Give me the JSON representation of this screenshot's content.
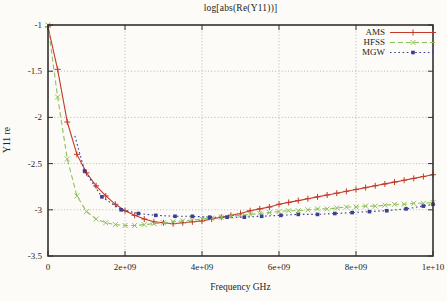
{
  "figure": {
    "background": "#fcfbf7",
    "axis_color": "#33312c",
    "grid_color": "#b8b8b8",
    "text_color": "#26241e"
  },
  "chart_data": {
    "type": "line",
    "title": "log[abs(Re(Y11))]",
    "xlabel": "Frequency GHz",
    "ylabel": "Y11 re",
    "xlim": [
      0,
      10
    ],
    "ylim": [
      -3.5,
      -1
    ],
    "grid": true,
    "legend_position": "top-right-inside",
    "x_ticks": [
      {
        "v": 0,
        "label": "0"
      },
      {
        "v": 2,
        "label": "2e+09"
      },
      {
        "v": 4,
        "label": "4e+09"
      },
      {
        "v": 6,
        "label": "6e+09"
      },
      {
        "v": 8,
        "label": "8e+09"
      },
      {
        "v": 10,
        "label": "1e+10"
      }
    ],
    "y_ticks": [
      {
        "v": -1,
        "label": "-1"
      },
      {
        "v": -1.5,
        "label": "-1.5"
      },
      {
        "v": -2,
        "label": "-2"
      },
      {
        "v": -2.5,
        "label": "-2.5"
      },
      {
        "v": -3,
        "label": "-3"
      },
      {
        "v": -3.5,
        "label": "-3.5"
      }
    ],
    "x_unit": "GHz",
    "series": [
      {
        "name": "AMS",
        "color": "#c13a28",
        "line": "solid",
        "marker": "plus",
        "marker_start_index": 0,
        "x": [
          0,
          0.25,
          0.5,
          0.75,
          1,
          1.25,
          1.5,
          1.75,
          2,
          2.25,
          2.5,
          2.75,
          3,
          3.25,
          3.5,
          3.75,
          4,
          4.25,
          4.5,
          4.75,
          5,
          5.25,
          5.5,
          5.75,
          6,
          6.25,
          6.5,
          6.75,
          7,
          7.25,
          7.5,
          7.75,
          8,
          8.25,
          8.5,
          8.75,
          9,
          9.25,
          9.5,
          9.75,
          10
        ],
        "y": [
          -1.02,
          -1.48,
          -2.05,
          -2.4,
          -2.6,
          -2.74,
          -2.85,
          -2.94,
          -3.01,
          -3.06,
          -3.1,
          -3.13,
          -3.14,
          -3.15,
          -3.14,
          -3.13,
          -3.12,
          -3.1,
          -3.08,
          -3.06,
          -3.04,
          -3.01,
          -2.99,
          -2.97,
          -2.94,
          -2.92,
          -2.9,
          -2.88,
          -2.86,
          -2.84,
          -2.82,
          -2.8,
          -2.78,
          -2.76,
          -2.74,
          -2.72,
          -2.7,
          -2.68,
          -2.66,
          -2.64,
          -2.62
        ]
      },
      {
        "name": "HFSS",
        "color": "#8fc05e",
        "line": "dashed",
        "marker": "cross",
        "marker_start_index": 0,
        "x": [
          0,
          0.25,
          0.5,
          0.75,
          1,
          1.25,
          1.5,
          1.75,
          2,
          2.25,
          2.5,
          2.75,
          3,
          3.25,
          3.5,
          3.75,
          4,
          4.25,
          4.5,
          4.75,
          5,
          5.25,
          5.5,
          5.75,
          6,
          6.25,
          6.5,
          6.75,
          7,
          7.25,
          7.5,
          7.75,
          8,
          8.25,
          8.5,
          8.75,
          9,
          9.25,
          9.5,
          9.75,
          10
        ],
        "y": [
          -1.0,
          -1.78,
          -2.45,
          -2.85,
          -3.02,
          -3.1,
          -3.14,
          -3.16,
          -3.17,
          -3.17,
          -3.16,
          -3.15,
          -3.14,
          -3.13,
          -3.12,
          -3.11,
          -3.1,
          -3.09,
          -3.08,
          -3.07,
          -3.06,
          -3.05,
          -3.04,
          -3.03,
          -3.02,
          -3.01,
          -3.01,
          -3.0,
          -2.99,
          -2.99,
          -2.98,
          -2.97,
          -2.97,
          -2.96,
          -2.96,
          -2.95,
          -2.94,
          -2.94,
          -2.93,
          -2.93,
          -2.92
        ]
      },
      {
        "name": "MGW",
        "color": "#3b3e94",
        "line": "dotted",
        "marker": "square",
        "marker_start_index": 1,
        "x": [
          0.7,
          0.95,
          1.4,
          1.9,
          2.35,
          2.8,
          3.3,
          3.75,
          4.2,
          4.65,
          5.1,
          5.55,
          6.05,
          6.5,
          7.0,
          7.45,
          7.9,
          8.35,
          8.8,
          9.3,
          9.75,
          10.0
        ],
        "y": [
          -2.2,
          -2.58,
          -2.86,
          -3.0,
          -3.04,
          -3.06,
          -3.07,
          -3.07,
          -3.08,
          -3.08,
          -3.08,
          -3.07,
          -3.06,
          -3.05,
          -3.05,
          -3.04,
          -3.03,
          -3.02,
          -3.01,
          -2.99,
          -2.96,
          -2.94
        ]
      }
    ]
  }
}
